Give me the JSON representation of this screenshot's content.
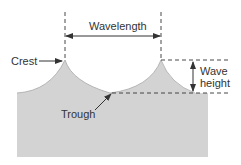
{
  "diagram": {
    "labels": {
      "wavelength": "Wavelength",
      "crest": "Crest",
      "trough": "Trough",
      "wave_height_line1": "Wave",
      "wave_height_line2": "height"
    },
    "colors": {
      "water": "#d0d0d0",
      "water_edge": "#a0a0a0",
      "lines": "#333333",
      "background": "#ffffff"
    }
  }
}
